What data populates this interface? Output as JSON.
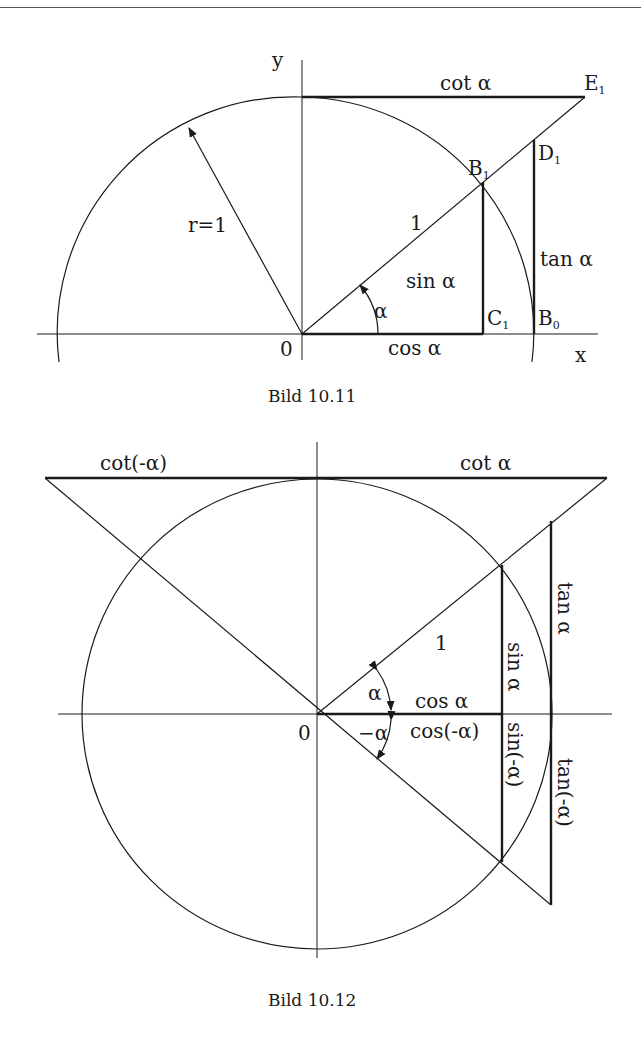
{
  "figures": [
    {
      "caption": "Bild 10.11",
      "labels": {
        "y_axis": "y",
        "x_axis": "x",
        "origin": "0",
        "radius": "r=1",
        "hypotenuse": "1",
        "angle": "α",
        "cot": "cot α",
        "sin": "sin α",
        "cos": "cos α",
        "tan": "tan α",
        "E1": "E",
        "E1_sub": "1",
        "B1": "B",
        "B1_sub": "1",
        "D1": "D",
        "D1_sub": "1",
        "C1": "C",
        "C1_sub": "1",
        "B0": "B",
        "B0_sub": "0"
      }
    },
    {
      "caption": "Bild 10.12",
      "labels": {
        "origin": "0",
        "hypotenuse": "1",
        "cot_neg": "cot(-α)",
        "cot": "cot α",
        "angle": "α",
        "angle_neg": "−α",
        "cos": "cos α",
        "cos_neg": "cos(-α)",
        "sin": "sin α",
        "sin_neg": "sin(-α)",
        "tan": "tan α",
        "tan_neg": "tan(-α)"
      }
    }
  ],
  "colors": {
    "ink": "#1a1a1a",
    "background": "#ffffff"
  }
}
